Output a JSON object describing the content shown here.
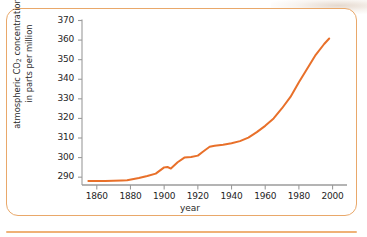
{
  "figure": {
    "border_color": "#e9a86a",
    "background": "#ffffff",
    "axis_color": "#9b9b9b",
    "line_color": "#e8702a"
  },
  "chart_data": {
    "type": "line",
    "title": "",
    "xlabel": "year",
    "ylabel_line1": "atmospheric CO",
    "ylabel_sub": "2",
    "ylabel_line1_tail": " concentration",
    "ylabel_line2": "in parts per million",
    "ylabel": "atmospheric CO2 concentration in parts per million",
    "xlim": [
      1853,
      2005
    ],
    "ylim": [
      286,
      370
    ],
    "grid": false,
    "legend": null,
    "xticks": [
      1860,
      1880,
      1900,
      1920,
      1940,
      1960,
      1980,
      2000
    ],
    "xtick_labels": [
      "1860",
      "1880",
      "1900",
      "1920",
      "1940",
      "1960",
      "1980",
      "2000"
    ],
    "yticks": [
      290,
      300,
      310,
      320,
      330,
      340,
      350,
      360,
      370
    ],
    "ytick_labels": [
      "290",
      "300",
      "310",
      "320",
      "330",
      "340",
      "350",
      "360",
      "370"
    ],
    "series": [
      {
        "name": "atmospheric CO2 concentration",
        "color": "#e8702a",
        "x": [
          1855,
          1865,
          1875,
          1878,
          1885,
          1890,
          1895,
          1900,
          1902,
          1904,
          1908,
          1912,
          1916,
          1920,
          1923,
          1927,
          1930,
          1935,
          1940,
          1945,
          1950,
          1955,
          1960,
          1965,
          1970,
          1975,
          1980,
          1985,
          1990,
          1995,
          1998
        ],
        "y": [
          288.0,
          288.1,
          288.3,
          288.4,
          289.6,
          290.6,
          291.8,
          295.0,
          295.2,
          294.4,
          297.6,
          300.0,
          300.3,
          301.0,
          303.0,
          305.5,
          306.0,
          306.6,
          307.3,
          308.4,
          310.2,
          313.0,
          316.2,
          320.0,
          325.2,
          331.0,
          338.5,
          345.5,
          352.5,
          358.0,
          360.8
        ]
      }
    ]
  }
}
